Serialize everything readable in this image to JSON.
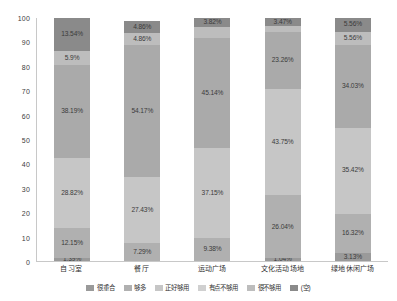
{
  "chart_data": {
    "type": "bar",
    "subtype": "stacked-percent-column",
    "title": "",
    "xlabel": "",
    "ylabel": "",
    "ylim": [
      0,
      100
    ],
    "yticks": [
      0,
      10,
      20,
      30,
      40,
      50,
      60,
      70,
      80,
      90,
      100
    ],
    "grid": false,
    "legend_position": "bottom",
    "categories": [
      "自习室",
      "餐厅",
      "运动广场",
      "文化活动场地",
      "绿地休闲广场"
    ],
    "series": [
      {
        "name": "很重合",
        "color": "#9a9a9a",
        "values": [
          1.39,
          0,
          0,
          1.04,
          3.13
        ],
        "labels": [
          "1.39%",
          "",
          "",
          "1.04%",
          "3.13%"
        ]
      },
      {
        "name": "够多",
        "color": "#b0b0b0",
        "values": [
          12.15,
          7.29,
          9.38,
          26.04,
          16.32
        ],
        "labels": [
          "12.15%",
          "7.29%",
          "9.38%",
          "26.04%",
          "16.32%"
        ]
      },
      {
        "name": "正好够用",
        "color": "#c6c6c6",
        "values": [
          28.82,
          27.43,
          37.15,
          43.75,
          35.42
        ],
        "labels": [
          "28.82%",
          "27.43%",
          "37.15%",
          "43.75%",
          "35.42%"
        ]
      },
      {
        "name": "有点不够用",
        "color": "#aaaaaa",
        "values": [
          38.19,
          54.17,
          45.14,
          23.26,
          34.03
        ],
        "labels": [
          "38.19%",
          "54.17%",
          "45.14%",
          "23.26%",
          "34.03%"
        ]
      },
      {
        "name": "很不够用",
        "color": "#bdbdbd",
        "values": [
          5.9,
          4.86,
          4.51,
          2.48,
          5.56
        ],
        "labels": [
          "5.9%",
          "4.86%",
          "",
          "",
          "5.56%"
        ]
      },
      {
        "name": "(空)",
        "color": "#8a8a8a",
        "values": [
          13.54,
          4.86,
          3.82,
          3.47,
          5.56
        ],
        "labels": [
          "13.54%",
          "4.86%",
          "3.82%",
          "3.47%",
          "5.56%"
        ]
      }
    ]
  },
  "axis": {
    "y_ticks": [
      "100",
      "90",
      "80",
      "70",
      "60",
      "50",
      "40",
      "30",
      "20",
      "10",
      "0"
    ]
  },
  "legend": {
    "items": [
      {
        "label": "很重合",
        "color": "#9a9a9a"
      },
      {
        "label": "够多",
        "color": "#b0b0b0"
      },
      {
        "label": "正好够用",
        "color": "#c6c6c6"
      },
      {
        "label": "有点不够用",
        "color": "#d0d0d0"
      },
      {
        "label": "很不够用",
        "color": "#bdbdbd"
      },
      {
        "label": "(空)",
        "color": "#8a8a8a"
      }
    ]
  }
}
